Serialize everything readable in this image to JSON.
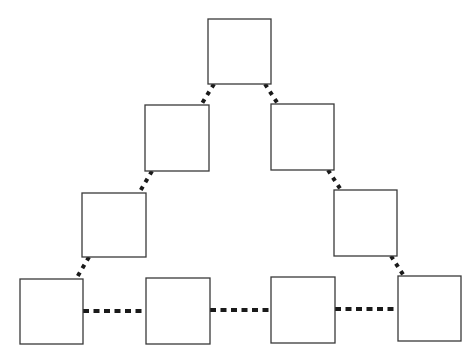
{
  "diagram": {
    "type": "triangle-of-boxes",
    "canvas": {
      "width": 473,
      "height": 360,
      "background": "#ffffff"
    },
    "style": {
      "box_stroke": "#3a3a3a",
      "box_fill": "#ffffff",
      "edge_color": "#1a1a1a",
      "edge_style": "dotted"
    },
    "nodes": [
      {
        "id": "top",
        "label": "",
        "x": 208,
        "y": 19,
        "w": 63,
        "h": 65
      },
      {
        "id": "row2-left",
        "label": "",
        "x": 145,
        "y": 105,
        "w": 64,
        "h": 66
      },
      {
        "id": "row2-right",
        "label": "",
        "x": 271,
        "y": 104,
        "w": 63,
        "h": 66
      },
      {
        "id": "row3-left",
        "label": "",
        "x": 82,
        "y": 193,
        "w": 64,
        "h": 64
      },
      {
        "id": "row3-right",
        "label": "",
        "x": 334,
        "y": 190,
        "w": 63,
        "h": 66
      },
      {
        "id": "bottom-1",
        "label": "",
        "x": 20,
        "y": 279,
        "w": 63,
        "h": 65
      },
      {
        "id": "bottom-2",
        "label": "",
        "x": 146,
        "y": 278,
        "w": 64,
        "h": 66
      },
      {
        "id": "bottom-3",
        "label": "",
        "x": 271,
        "y": 277,
        "w": 64,
        "h": 66
      },
      {
        "id": "bottom-4",
        "label": "",
        "x": 398,
        "y": 276,
        "w": 63,
        "h": 65
      }
    ],
    "edges": [
      {
        "from": "top",
        "to": "row2-left",
        "x1": 214,
        "y1": 84,
        "x2": 201,
        "y2": 105,
        "orientation": "diagonal"
      },
      {
        "from": "top",
        "to": "row2-right",
        "x1": 265,
        "y1": 84,
        "x2": 278,
        "y2": 104,
        "orientation": "diagonal"
      },
      {
        "from": "row2-left",
        "to": "row3-left",
        "x1": 152,
        "y1": 171,
        "x2": 139,
        "y2": 193,
        "orientation": "diagonal"
      },
      {
        "from": "row2-right",
        "to": "row3-right",
        "x1": 328,
        "y1": 170,
        "x2": 341,
        "y2": 190,
        "orientation": "diagonal"
      },
      {
        "from": "row3-left",
        "to": "bottom-1",
        "x1": 89,
        "y1": 257,
        "x2": 76,
        "y2": 279,
        "orientation": "diagonal"
      },
      {
        "from": "row3-right",
        "to": "bottom-4",
        "x1": 391,
        "y1": 256,
        "x2": 404,
        "y2": 276,
        "orientation": "diagonal"
      },
      {
        "from": "bottom-1",
        "to": "bottom-2",
        "x1": 83,
        "y1": 311,
        "x2": 146,
        "y2": 311,
        "orientation": "horizontal"
      },
      {
        "from": "bottom-2",
        "to": "bottom-3",
        "x1": 210,
        "y1": 310,
        "x2": 271,
        "y2": 310,
        "orientation": "horizontal"
      },
      {
        "from": "bottom-3",
        "to": "bottom-4",
        "x1": 335,
        "y1": 309,
        "x2": 398,
        "y2": 309,
        "orientation": "horizontal"
      }
    ]
  }
}
